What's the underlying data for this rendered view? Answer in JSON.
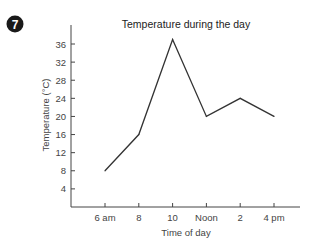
{
  "badge": {
    "number": "7",
    "color": "#1a1a1a"
  },
  "chart_data": {
    "type": "line",
    "title": "Temperature during the day",
    "xlabel": "Time of day",
    "ylabel": "Temperature (°C)",
    "categories": [
      "6 am",
      "8",
      "10",
      "Noon",
      "2",
      "4 pm"
    ],
    "series": [
      {
        "name": "Temperature",
        "values": [
          8,
          16,
          37,
          20,
          24,
          20
        ],
        "color": "#333333"
      }
    ],
    "yticks": [
      4,
      8,
      12,
      16,
      20,
      24,
      28,
      32,
      36
    ],
    "ylim": [
      0,
      40
    ],
    "grid": false,
    "legend": "none"
  }
}
